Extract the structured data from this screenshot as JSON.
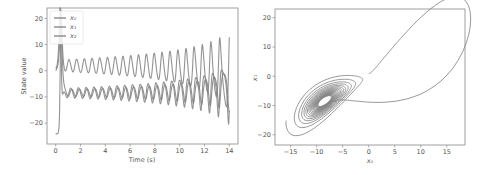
{
  "chart_data": [
    {
      "type": "line",
      "title": "",
      "xlabel": "Time (s)",
      "ylabel": "State value",
      "xlim": [
        -0.7,
        14.7
      ],
      "ylim": [
        -28,
        24
      ],
      "xticks": [
        0,
        2,
        4,
        6,
        8,
        10,
        12,
        14
      ],
      "yticks": [
        -20,
        -10,
        0,
        10,
        20
      ],
      "grid": false,
      "legend_position": "upper left",
      "series": [
        {
          "name": "x0",
          "label": "x₀",
          "color": "#808080"
        },
        {
          "name": "x1",
          "label": "x₁",
          "color": "#808080"
        },
        {
          "name": "x2",
          "label": "x₂",
          "color": "#808080"
        }
      ],
      "system": {
        "model": "lorenz-like",
        "t_start": 0,
        "t_end": 14,
        "sigma": 10,
        "rho": 28,
        "beta": 2.667,
        "initial": [
          0,
          1,
          1.05
        ],
        "z_offset": -25
      },
      "value_range": {
        "x0": [
          -17,
          18
        ],
        "x1": [
          -22,
          21
        ],
        "x2": [
          -25,
          21
        ]
      }
    },
    {
      "type": "line",
      "title": "",
      "xlabel": "x₀",
      "ylabel": "x₁",
      "xlim": [
        -18,
        18.5
      ],
      "ylim": [
        -23.5,
        23
      ],
      "xticks": [
        -15,
        -10,
        -5,
        0,
        5,
        10,
        15
      ],
      "yticks": [
        -20,
        -10,
        0,
        10,
        20
      ],
      "grid": false,
      "series": [
        {
          "name": "x0 vs x1 phase portrait",
          "color": "#808080"
        }
      ]
    }
  ],
  "left_axes": {
    "xlabel": "Time (s)",
    "ylabel": "State value",
    "legend": [
      "x₀",
      "x₁",
      "x₂"
    ]
  },
  "right_axes": {
    "xlabel": "x₀",
    "ylabel": "x₁"
  }
}
